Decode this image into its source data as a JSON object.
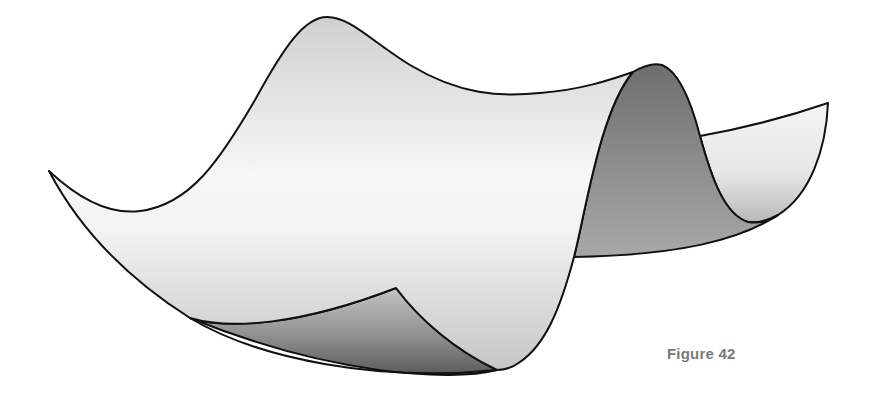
{
  "figure": {
    "caption": "Figure 42",
    "colors": {
      "outline": "#111111",
      "light_face": "#f2f2f2",
      "mid_face": "#c8c8c8",
      "dark_face": "#7e7e7e",
      "caption": "#7a7a7a",
      "background": "#ffffff"
    }
  }
}
